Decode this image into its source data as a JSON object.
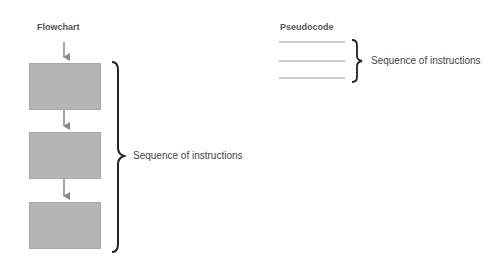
{
  "flowchart": {
    "title": "Flowchart",
    "steps": 3,
    "brace_label": "Sequence of instructions",
    "box_color": "#b5b5b5",
    "arrow_color": "#888888"
  },
  "pseudocode": {
    "title": "Pseudocode",
    "lines": 3,
    "brace_label": "Sequence of instructions",
    "line_color": "#999999"
  }
}
